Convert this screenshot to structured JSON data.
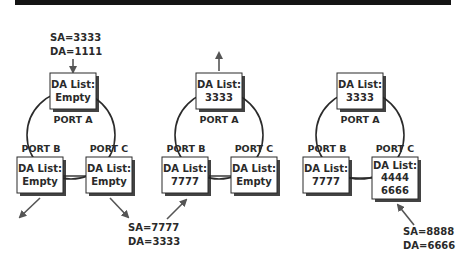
{
  "colors": {
    "top_bar": "#141414",
    "line": "#2b2b2b",
    "arrow": "#555555",
    "box_fill": "#ffffff",
    "box_stroke": "#2b2b2b",
    "shadow": "#222222",
    "text": "#2a2a2a"
  },
  "diagrams": [
    {
      "ports": {
        "a": {
          "label": "PORT A",
          "list_title": "DA List:",
          "entries": [
            "Empty"
          ]
        },
        "b": {
          "label": "PORT B",
          "list_title": "DA List:",
          "entries": [
            "Empty"
          ]
        },
        "c": {
          "label": "PORT C",
          "list_title": "DA List:",
          "entries": [
            "Empty"
          ]
        }
      },
      "frame": {
        "sa": "SA=3333",
        "da": "DA=1111",
        "direction": "incoming on Port A"
      },
      "outgoing": [
        "Port B",
        "Port C"
      ]
    },
    {
      "ports": {
        "a": {
          "label": "PORT A",
          "list_title": "DA List:",
          "entries": [
            "3333"
          ]
        },
        "b": {
          "label": "PORT B",
          "list_title": "DA List:",
          "entries": [
            "7777"
          ]
        },
        "c": {
          "label": "PORT C",
          "list_title": "DA List:",
          "entries": [
            "Empty"
          ]
        }
      },
      "frame": {
        "sa": "SA=7777",
        "da": "DA=3333",
        "direction": "incoming on Port B"
      },
      "outgoing": [
        "Port A"
      ]
    },
    {
      "ports": {
        "a": {
          "label": "PORT A",
          "list_title": "DA List:",
          "entries": [
            "3333"
          ]
        },
        "b": {
          "label": "PORT B",
          "list_title": "DA List:",
          "entries": [
            "7777"
          ]
        },
        "c": {
          "label": "PORT C",
          "list_title": "DA List:",
          "entries": [
            "4444",
            "6666"
          ]
        }
      },
      "frame": {
        "sa": "SA=8888",
        "da": "DA=6666",
        "direction": "incoming on Port C"
      },
      "outgoing": []
    }
  ]
}
